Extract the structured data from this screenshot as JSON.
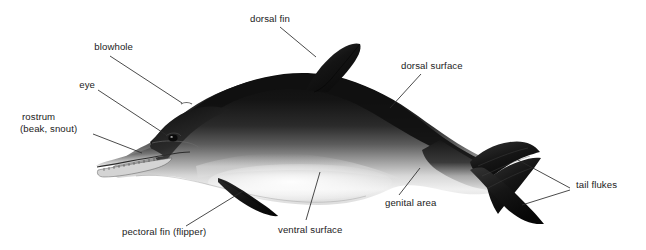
{
  "figure": {
    "background_color": "#ffffff",
    "label_color": "#1b1b1b",
    "leader_color": "#2a2a2a",
    "width": 646,
    "height": 250
  },
  "labels": {
    "dorsal_fin": "dorsal fin",
    "blowhole": "blowhole",
    "eye": "eye",
    "rostrum_line1": "rostrum",
    "rostrum_line2": "(beak, snout)",
    "dorsal_surface": "dorsal surface",
    "tail_flukes": "tail flukes",
    "genital_area": "genital area",
    "ventral_surface": "ventral surface",
    "pectoral_fin": "pectoral fin (flipper)"
  },
  "anatomy_parts": [
    {
      "name": "dorsal fin",
      "text_x": 250,
      "text_y": 17,
      "tip_x": 316,
      "tip_y": 57
    },
    {
      "name": "blowhole",
      "text_x": 84,
      "text_y": 45,
      "tip_x": 182,
      "tip_y": 103
    },
    {
      "name": "eye",
      "text_x": 73,
      "text_y": 83,
      "tip_x": 168,
      "tip_y": 136
    },
    {
      "name": "rostrum (beak, snout)",
      "text_x": 22,
      "text_y": 113,
      "tip_x": 140,
      "tip_y": 152
    },
    {
      "name": "dorsal surface",
      "text_x": 401,
      "text_y": 62,
      "tip_x": 390,
      "tip_y": 108
    },
    {
      "name": "tail flukes",
      "text_x": 576,
      "text_y": 181,
      "tip_x": 518,
      "tip_y": 160
    },
    {
      "name": "genital area",
      "text_x": 385,
      "text_y": 199,
      "tip_x": 420,
      "tip_y": 168
    },
    {
      "name": "ventral surface",
      "text_x": 278,
      "text_y": 226,
      "tip_x": 318,
      "tip_y": 172
    },
    {
      "name": "pectoral fin (flipper)",
      "text_x": 122,
      "text_y": 228,
      "tip_x": 243,
      "tip_y": 191
    }
  ],
  "palette": {
    "dorsal_dark": "#141414",
    "dorsal_mid": "#3b3b3b",
    "flank_grey": "#8d8d8d",
    "ventral_light": "#f2f2f2",
    "ventral_shadow": "#cfcfcf",
    "outline": "#0d0d0d"
  }
}
